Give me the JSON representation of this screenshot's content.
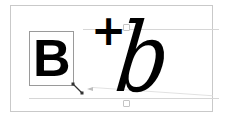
{
  "diagram": {
    "glyph_bold": "B",
    "operator": "+",
    "glyph_italic": "b",
    "colors": {
      "frame_border": "#c9c9c9",
      "guide_line": "#d6d6d6",
      "selection_box": "#9a9a9a",
      "glyph": "#000000"
    },
    "icons": {
      "resize_handle": "diagonal-resize-icon",
      "guide_handle_top": "square-handle-icon",
      "guide_handle_base": "square-handle-icon"
    }
  }
}
